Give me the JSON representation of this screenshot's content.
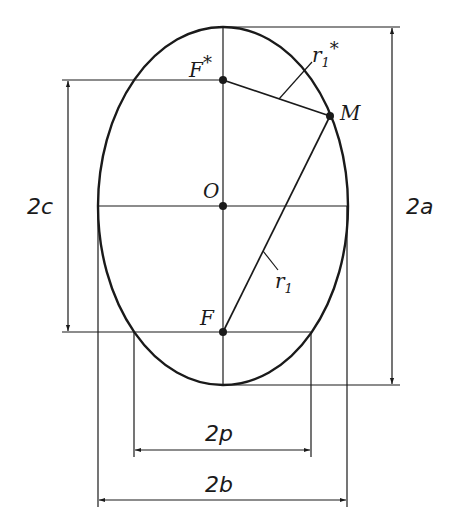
{
  "diagram": {
    "type": "ellipse-geometry",
    "center": {
      "label": "O",
      "x": 223,
      "y": 206
    },
    "semi_axes": {
      "a_px": 179,
      "b_px": 125
    },
    "foci": [
      {
        "label": "F*",
        "x": 223,
        "y": 80
      },
      {
        "label": "F",
        "x": 223,
        "y": 332
      }
    ],
    "point": {
      "label": "M",
      "x": 330,
      "y": 116
    },
    "radii": [
      {
        "label": "r1*",
        "from": "F*",
        "to": "M"
      },
      {
        "label": "r1",
        "from": "F",
        "to": "M"
      }
    ],
    "labels": {
      "center": "O",
      "focus_top": "F",
      "focus_top_star": "*",
      "focus_bottom": "F",
      "point": "M",
      "r1_star": "r",
      "r1_star_sub": "1",
      "r1_star_sup": "*",
      "r1": "r",
      "r1_sub": "1"
    },
    "dimensions": {
      "two_a": "2a",
      "two_c": "2c",
      "two_p": "2p",
      "two_b": "2b"
    },
    "colors": {
      "line": "#1a1a1a",
      "background": "#ffffff"
    }
  }
}
